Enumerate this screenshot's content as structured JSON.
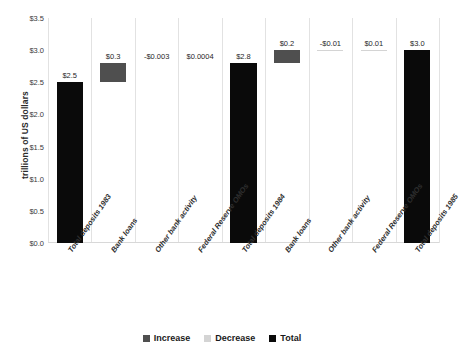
{
  "chart_data": {
    "type": "bar",
    "subtype": "waterfall",
    "title": "",
    "xlabel": "",
    "ylabel": "trillions of US dollars",
    "ylim": [
      0.0,
      3.5
    ],
    "ytick_labels": [
      "$3.5",
      "$3.0",
      "$2.5",
      "$2.0",
      "$1.5",
      "$1.0",
      "$0.5",
      "$0.0"
    ],
    "ytick_values": [
      3.5,
      3.0,
      2.5,
      2.0,
      1.5,
      1.0,
      0.5,
      0.0
    ],
    "grid": "vertical-only",
    "legend_position": "bottom-center",
    "legend": [
      {
        "label": "Increase",
        "color": "#4f4f4f"
      },
      {
        "label": "Decrease",
        "color": "#d4d4d4"
      },
      {
        "label": "Total",
        "color": "#0a0a0a"
      }
    ],
    "categories": [
      "Total deposits 1983",
      "Bank loans",
      "Other bank activity",
      "Federal Reserve OMOs",
      "Total deposits 1984",
      "Bank loans",
      "Other bank activity",
      "Federal Reserve OMOs",
      "Total deposits 1985"
    ],
    "values": [
      2.5,
      0.3,
      -0.003,
      0.0004,
      2.8,
      0.2,
      -0.01,
      0.01,
      3.0
    ],
    "data_labels": [
      "$2.5",
      "$0.3",
      "-$0.003",
      "$0.0004",
      "$2.8",
      "$0.2",
      "-$0.01",
      "$0.01",
      "$3.0"
    ],
    "series_types": [
      "total",
      "increase",
      "decrease",
      "increase",
      "total",
      "increase",
      "decrease",
      "decrease",
      "total"
    ],
    "bar_base": [
      0.0,
      2.5,
      2.8,
      2.797,
      0.0,
      2.8,
      3.0,
      2.99,
      0.0
    ],
    "bar_top": [
      2.5,
      2.8,
      2.797,
      2.7974,
      2.8,
      3.0,
      2.99,
      3.0,
      3.0
    ]
  }
}
